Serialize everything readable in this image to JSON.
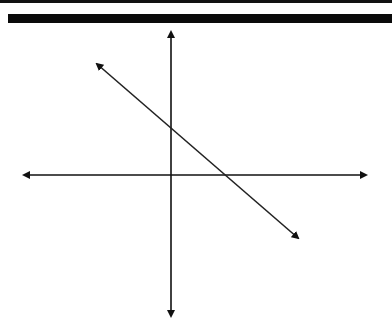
{
  "diagram": {
    "type": "coordinate-plane-with-line",
    "colors": {
      "axis": "#111111",
      "line": "#222222",
      "background": "#ffffff"
    },
    "axes": {
      "x_axis": {
        "y": 175,
        "x1": 22,
        "x2": 368,
        "arrows": "both"
      },
      "y_axis": {
        "x": 171,
        "y1": 30,
        "y2": 318,
        "arrows": "both"
      }
    },
    "line": {
      "x1": 95,
      "y1": 62,
      "x2": 300,
      "y2": 240,
      "arrows": "both",
      "slope": "negative"
    }
  }
}
